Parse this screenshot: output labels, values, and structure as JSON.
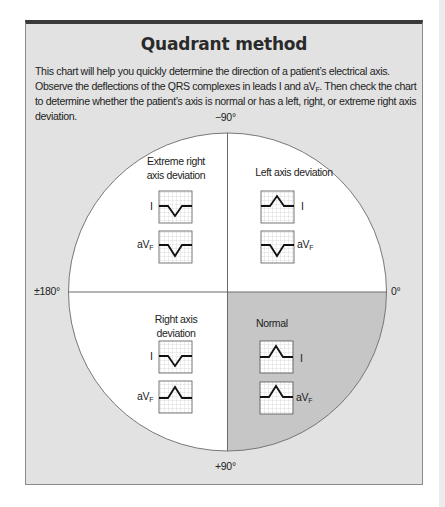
{
  "title": "Quadrant method",
  "intro": {
    "part1": "This chart will help you quickly determine the direction of a patient’s electrical axis. Observe the deflections of the QRS complexes in leads I and aV",
    "sub": "F",
    "part2": ". Then check the chart to determine whether the patient’s axis is normal or has a left, right, or extreme right axis deviation."
  },
  "axis_labels": {
    "top": "−90°",
    "bottom": "+90°",
    "left": "±180°",
    "right": "0°"
  },
  "quadrants": {
    "top_left": {
      "label_line1": "Extreme right",
      "label_line2": "axis deviation",
      "lead_I": "negative",
      "lead_aVF": "negative"
    },
    "top_right": {
      "label_line1": "Left axis deviation",
      "lead_I": "positive",
      "lead_aVF": "negative"
    },
    "bottom_left": {
      "label_line1": "Right axis",
      "label_line2": "deviation",
      "lead_I": "negative",
      "lead_aVF": "positive"
    },
    "bottom_right": {
      "label_line1": "Normal",
      "lead_I": "positive",
      "lead_aVF": "positive",
      "highlighted": true
    }
  },
  "leads": {
    "I": "I",
    "aVF_main": "aV",
    "aVF_sub": "F"
  },
  "colors": {
    "panel_bg": "#e2e2e2",
    "panel_top_border": "#3a3a3a",
    "circle_fill": "#ffffff",
    "normal_quadrant_fill": "#c6c6c6",
    "trace": "#111111",
    "grid": "#b8b8b8"
  }
}
